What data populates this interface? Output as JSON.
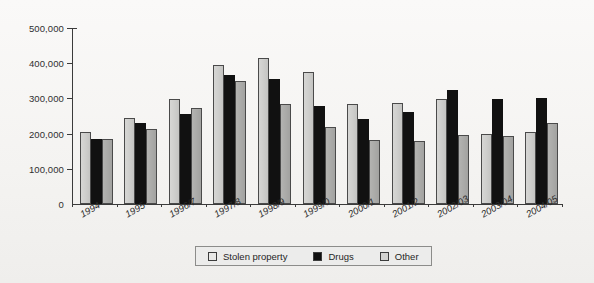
{
  "chart_data": {
    "type": "bar",
    "title": "",
    "xlabel": "",
    "ylabel": "",
    "ylim": [
      0,
      500000
    ],
    "ytick_labels": [
      "500,000",
      "400,000",
      "300,000",
      "200,000",
      "100,000",
      "0"
    ],
    "ytick_values": [
      500000,
      400000,
      300000,
      200000,
      100000,
      0
    ],
    "grid": false,
    "legend_position": "bottom",
    "categories": [
      "1994",
      "1995",
      "1996/7",
      "1997/8",
      "1998/9",
      "1999/0",
      "2000/1",
      "2001/2",
      "2002/03",
      "2003/04",
      "2004/05"
    ],
    "series": [
      {
        "name": "Stolen property",
        "color": "#cfcfcd",
        "values": [
          205000,
          245000,
          297000,
          394000,
          416000,
          374000,
          284000,
          288000,
          299000,
          198000,
          205000
        ]
      },
      {
        "name": "Drugs",
        "color": "#111111",
        "values": [
          185000,
          229000,
          256000,
          366000,
          356000,
          278000,
          242000,
          261000,
          325000,
          298000,
          302000
        ]
      },
      {
        "name": "Other",
        "color": "#a9a9a7",
        "values": [
          185000,
          212000,
          273000,
          349000,
          285000,
          219000,
          182000,
          180000,
          196000,
          193000,
          230000
        ]
      }
    ]
  },
  "legend": {
    "items": [
      {
        "label": "Stolen property",
        "swatch": "stolen"
      },
      {
        "label": "Drugs",
        "swatch": "drugs"
      },
      {
        "label": "Other",
        "swatch": "other"
      }
    ]
  }
}
